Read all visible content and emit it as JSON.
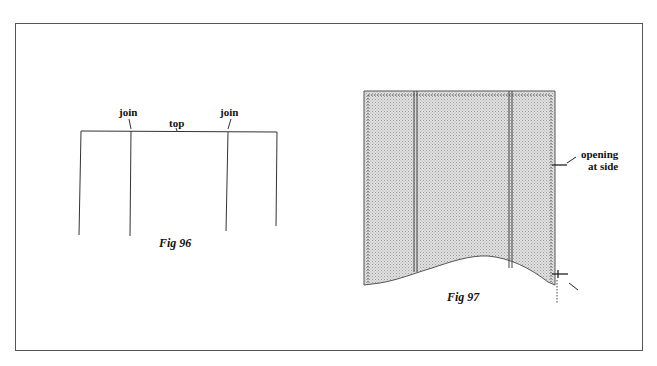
{
  "figure_96": {
    "labels": {
      "join_left": "join",
      "top": "top",
      "join_right": "join"
    },
    "caption": "Fig 96"
  },
  "figure_97": {
    "labels": {
      "opening_line1": "opening",
      "opening_line2": "at side"
    },
    "caption": "Fig 97"
  },
  "colors": {
    "frame": "#555555",
    "line": "#333333",
    "fill": "#d4d4d4"
  }
}
